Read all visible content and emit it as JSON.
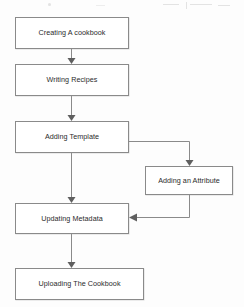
{
  "diagram": {
    "type": "flowchart",
    "orientation": "top-to-bottom",
    "nodes": [
      {
        "id": "creating_cookbook",
        "label": "Creating A cookbook"
      },
      {
        "id": "writing_recipes",
        "label": "Writing Recipes"
      },
      {
        "id": "adding_template",
        "label": "Adding Template"
      },
      {
        "id": "adding_attribute",
        "label": "Adding an Attribute"
      },
      {
        "id": "updating_metadata",
        "label": "Updating Metadata"
      },
      {
        "id": "uploading_cookbook",
        "label": "Uploading The Cookbook"
      }
    ],
    "edges": [
      {
        "from": "creating_cookbook",
        "to": "writing_recipes",
        "style": "straight-down",
        "arrow": true
      },
      {
        "from": "writing_recipes",
        "to": "adding_template",
        "style": "straight-down",
        "arrow": true
      },
      {
        "from": "adding_template",
        "to": "updating_metadata",
        "style": "straight-down",
        "arrow": true
      },
      {
        "from": "adding_template",
        "to": "adding_attribute",
        "style": "right-then-down",
        "arrow": true
      },
      {
        "from": "adding_attribute",
        "to": "updating_metadata",
        "style": "down-then-left",
        "arrow": true
      },
      {
        "from": "updating_metadata",
        "to": "uploading_cookbook",
        "style": "straight-down",
        "arrow": true
      }
    ]
  },
  "colors": {
    "node_border": "#8a8a8a",
    "node_fill": "#ffffff",
    "connector": "#8a8a8a",
    "arrowhead": "#5f5f5f",
    "label_text": "#2b2b2b",
    "page_background": "#fdfdfd"
  }
}
